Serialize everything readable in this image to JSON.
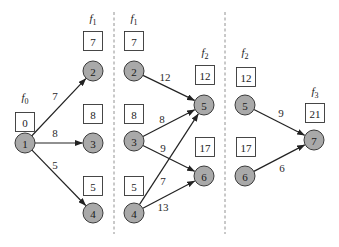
{
  "diagram": {
    "type": "stagewise-shortest-path",
    "stages": [
      {
        "label": "f",
        "subscript": "0",
        "label_pos": [
          25,
          101
        ],
        "nodes": [
          {
            "id": "1",
            "x": 25,
            "y": 143,
            "box_value": "0",
            "box": [
              15,
              112
            ]
          }
        ]
      },
      {
        "label": "f",
        "subscript": "1",
        "label_pos": [
          93,
          22
        ],
        "nodes": [
          {
            "id": "2",
            "x": 93,
            "y": 71,
            "box_value": "7",
            "box": [
              83,
              31
            ]
          },
          {
            "id": "3",
            "x": 93,
            "y": 143,
            "box_value": "8",
            "box": [
              83,
              104
            ]
          },
          {
            "id": "4",
            "x": 93,
            "y": 213,
            "box_value": "5",
            "box": [
              83,
              176
            ]
          }
        ]
      },
      {
        "label": "f",
        "subscript": "1",
        "label_pos": [
          134,
          22
        ],
        "nodes": [
          {
            "id": "2",
            "x": 134,
            "y": 71,
            "box_value": "7",
            "box": [
              124,
              31
            ]
          },
          {
            "id": "3",
            "x": 134,
            "y": 141,
            "box_value": "8",
            "box": [
              124,
              104
            ]
          },
          {
            "id": "4",
            "x": 134,
            "y": 213,
            "box_value": "5",
            "box": [
              124,
              176
            ]
          }
        ]
      },
      {
        "label": "f",
        "subscript": "2",
        "label_pos": [
          205,
          56
        ],
        "nodes": [
          {
            "id": "5",
            "x": 204,
            "y": 105,
            "box_value": "12",
            "box": [
              195,
              65
            ]
          },
          {
            "id": "6",
            "x": 204,
            "y": 176,
            "box_value": "17",
            "box": [
              195,
              137
            ]
          }
        ]
      },
      {
        "label": "f",
        "subscript": "2",
        "label_pos": [
          245,
          56
        ],
        "nodes": [
          {
            "id": "5",
            "x": 245,
            "y": 105,
            "box_value": "12",
            "box": [
              236,
              67
            ]
          },
          {
            "id": "6",
            "x": 245,
            "y": 176,
            "box_value": "17",
            "box": [
              236,
              137
            ]
          }
        ]
      },
      {
        "label": "f",
        "subscript": "3",
        "label_pos": [
          315,
          95
        ],
        "nodes": [
          {
            "id": "7",
            "x": 314,
            "y": 140,
            "box_value": "21",
            "box": [
              305,
              103
            ]
          }
        ]
      }
    ],
    "edges": [
      {
        "from": [
          25,
          143
        ],
        "to": [
          93,
          71
        ],
        "weight": "7",
        "label_pos": [
          55,
          96
        ]
      },
      {
        "from": [
          25,
          143
        ],
        "to": [
          93,
          143
        ],
        "weight": "8",
        "label_pos": [
          55,
          133
        ]
      },
      {
        "from": [
          25,
          143
        ],
        "to": [
          93,
          213
        ],
        "weight": "5",
        "label_pos": [
          55,
          165
        ]
      },
      {
        "from": [
          134,
          71
        ],
        "to": [
          204,
          105
        ],
        "weight": "12",
        "label_pos": [
          165,
          77
        ]
      },
      {
        "from": [
          134,
          141
        ],
        "to": [
          204,
          105
        ],
        "weight": "8",
        "label_pos": [
          162,
          119
        ]
      },
      {
        "from": [
          134,
          141
        ],
        "to": [
          204,
          176
        ],
        "weight": "9",
        "label_pos": [
          163,
          148
        ]
      },
      {
        "from": [
          134,
          213
        ],
        "to": [
          204,
          105
        ],
        "weight": "7",
        "label_pos": [
          163,
          181
        ]
      },
      {
        "from": [
          134,
          213
        ],
        "to": [
          204,
          176
        ],
        "weight": "13",
        "label_pos": [
          163,
          207
        ]
      },
      {
        "from": [
          245,
          105
        ],
        "to": [
          314,
          140
        ],
        "weight": "9",
        "label_pos": [
          281,
          113
        ]
      },
      {
        "from": [
          245,
          176
        ],
        "to": [
          314,
          140
        ],
        "weight": "6",
        "label_pos": [
          282,
          168
        ]
      }
    ],
    "dividers": [
      {
        "x": 114,
        "y1": 12,
        "y2": 234
      },
      {
        "x": 225,
        "y1": 12,
        "y2": 234
      }
    ],
    "colors": {
      "node_fill": "#a9a9a9",
      "node_stroke": "#3a3a3a",
      "edge": "#222222",
      "box_stroke": "#333333",
      "divider": "#777777"
    },
    "node_radius": 10,
    "box_size": 19
  }
}
